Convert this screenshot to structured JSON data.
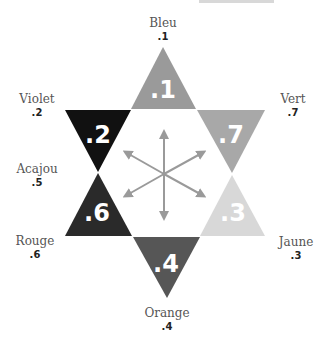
{
  "diagram": {
    "type": "hexagram-color-scheme",
    "arrow_color": "#9a9a9a",
    "triangles": [
      {
        "name": "Bleu",
        "value": ".1",
        "color": "#9a9a9a",
        "position": "top"
      },
      {
        "name": "Vert",
        "value": ".7",
        "color": "#a8a8a8",
        "position": "upper-right"
      },
      {
        "name": "Jaune",
        "value": ".3",
        "color": "#d8d8d8",
        "position": "lower-right"
      },
      {
        "name": "Orange",
        "value": ".4",
        "color": "#565656",
        "position": "bottom"
      },
      {
        "name": "Rouge",
        "value": ".6",
        "color": "#2a2a2a",
        "position": "lower-left"
      },
      {
        "name": "Violet",
        "value": ".2",
        "color": "#111111",
        "position": "upper-left"
      }
    ],
    "labels": [
      {
        "name": "Bleu",
        "value": ".1"
      },
      {
        "name": "Violet",
        "value": ".2"
      },
      {
        "name": "Vert",
        "value": ".7"
      },
      {
        "name": "Acajou",
        "value": ".5"
      },
      {
        "name": "Rouge",
        "value": ".6"
      },
      {
        "name": "Jaune",
        "value": ".3"
      },
      {
        "name": "Orange",
        "value": ".4"
      }
    ]
  }
}
